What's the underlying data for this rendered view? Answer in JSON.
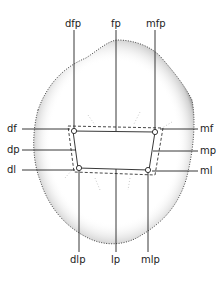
{
  "diagram": {
    "labels": {
      "dfp": "dfp",
      "fp": "fp",
      "mfp": "mfp",
      "df": "df",
      "dp": "dp",
      "dl": "dl",
      "mf": "mf",
      "mp": "mp",
      "ml": "ml",
      "dlp": "dlp",
      "lp": "lp",
      "mlp": "mlp"
    },
    "colors": {
      "ink": "#222222",
      "stipple": "#555555",
      "background": "#ffffff"
    }
  }
}
